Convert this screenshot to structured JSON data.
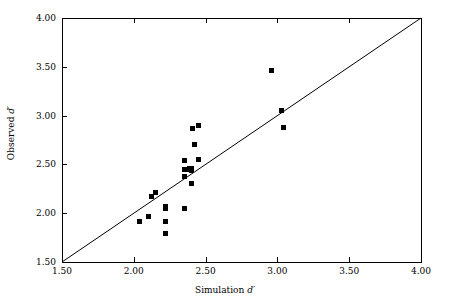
{
  "chart_data": {
    "type": "scatter",
    "title": "",
    "xlabel": "Simulation d′",
    "ylabel": "Observed d′",
    "xlim": [
      1.5,
      4.0
    ],
    "ylim": [
      1.5,
      4.0
    ],
    "xticks": [
      "1.50",
      "2.00",
      "2.50",
      "3.00",
      "3.50",
      "4.00"
    ],
    "xtick_values": [
      1.5,
      2.0,
      2.5,
      3.0,
      3.5,
      4.0
    ],
    "yticks": [
      "1.50",
      "2.00",
      "2.50",
      "3.00",
      "3.50",
      "4.00"
    ],
    "ytick_values": [
      1.5,
      2.0,
      2.5,
      3.0,
      3.5,
      4.0
    ],
    "grid": false,
    "legend": "none",
    "marker": "filled-square",
    "marker_color": "#000000",
    "reference_line": {
      "name": "identity-line",
      "type": "line",
      "from": [
        1.5,
        1.5
      ],
      "to": [
        4.0,
        4.0
      ],
      "color": "#000000"
    },
    "series": [
      {
        "name": "observed-vs-simulation",
        "points": [
          [
            2.04,
            1.92
          ],
          [
            2.1,
            1.97
          ],
          [
            2.12,
            2.17
          ],
          [
            2.15,
            2.21
          ],
          [
            2.22,
            2.07
          ],
          [
            2.22,
            2.05
          ],
          [
            2.22,
            1.92
          ],
          [
            2.22,
            1.79
          ],
          [
            2.35,
            2.54
          ],
          [
            2.35,
            2.45
          ],
          [
            2.35,
            2.38
          ],
          [
            2.35,
            2.05
          ],
          [
            2.38,
            2.45
          ],
          [
            2.39,
            2.46
          ],
          [
            2.4,
            2.44
          ],
          [
            2.4,
            2.46
          ],
          [
            2.4,
            2.3
          ],
          [
            2.41,
            2.87
          ],
          [
            2.42,
            2.7
          ],
          [
            2.45,
            2.9
          ],
          [
            2.45,
            2.55
          ],
          [
            2.96,
            3.46
          ],
          [
            3.03,
            3.05
          ],
          [
            3.04,
            2.88
          ]
        ]
      }
    ]
  }
}
